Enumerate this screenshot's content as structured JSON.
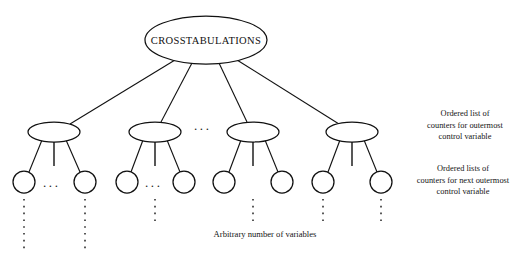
{
  "diagram": {
    "type": "tree",
    "title_node": "CROSSTABULATIONS",
    "root": {
      "label": "CROSSTABULATIONS",
      "cx": 206,
      "cy": 40,
      "rx": 61,
      "ry": 24
    },
    "level2_nodes": [
      {
        "id": "ellipse-1",
        "cx": 54,
        "cy": 132,
        "rx": 26,
        "ry": 10
      },
      {
        "id": "ellipse-2",
        "cx": 155,
        "cy": 132,
        "rx": 26,
        "ry": 10
      },
      {
        "id": "ellipse-3",
        "cx": 253,
        "cy": 132,
        "rx": 26,
        "ry": 10
      },
      {
        "id": "ellipse-4",
        "cx": 352,
        "cy": 132,
        "rx": 26,
        "ry": 10
      }
    ],
    "level3_nodes": [
      {
        "id": "circle-1",
        "cx": 24,
        "cy": 182,
        "r": 11,
        "parent": "ellipse-1"
      },
      {
        "id": "circle-2",
        "cx": 85,
        "cy": 182,
        "r": 11,
        "parent": "ellipse-1"
      },
      {
        "id": "circle-3",
        "cx": 127,
        "cy": 182,
        "r": 11,
        "parent": "ellipse-2"
      },
      {
        "id": "circle-4",
        "cx": 184,
        "cy": 182,
        "r": 11,
        "parent": "ellipse-2"
      },
      {
        "id": "circle-5",
        "cx": 224,
        "cy": 182,
        "r": 11,
        "parent": "ellipse-3"
      },
      {
        "id": "circle-6",
        "cx": 282,
        "cy": 182,
        "r": 11,
        "parent": "ellipse-3"
      },
      {
        "id": "circle-7",
        "cx": 323,
        "cy": 182,
        "r": 11,
        "parent": "ellipse-4"
      },
      {
        "id": "circle-8",
        "cx": 381,
        "cy": 182,
        "r": 11,
        "parent": "ellipse-4"
      }
    ],
    "horizontal_ellipses": [
      {
        "id": "hdots-level2",
        "x": 204,
        "y": 129,
        "text": "..."
      },
      {
        "id": "hdots-leaf-1",
        "x": 48,
        "y": 186,
        "text": "..."
      },
      {
        "id": "hdots-leaf-2",
        "x": 150,
        "y": 186,
        "text": "..."
      }
    ],
    "vertical_dot_columns": [
      {
        "id": "vdots-1",
        "x": 24,
        "y1": 199,
        "y2": 250
      },
      {
        "id": "vdots-2",
        "x": 85,
        "y1": 199,
        "y2": 250
      },
      {
        "id": "vdots-3",
        "x": 155,
        "y1": 199,
        "y2": 222
      },
      {
        "id": "vdots-4",
        "x": 253,
        "y1": 199,
        "y2": 222
      },
      {
        "id": "vdots-5",
        "x": 323,
        "y1": 199,
        "y2": 222
      },
      {
        "id": "vdots-6",
        "x": 381,
        "y1": 199,
        "y2": 222
      }
    ]
  },
  "annotations": {
    "outermost_note": "Ordered list of\ncounters for outermost\ncontrol variable",
    "next_outermost_note": "Ordered lists of\ncounters for next outermost\ncontrol variable",
    "bottom_caption": "Arbitrary number of variables"
  },
  "colors": {
    "stroke": "#111111",
    "background": "#ffffff",
    "text": "#141414"
  }
}
